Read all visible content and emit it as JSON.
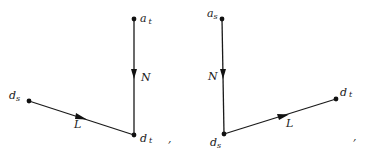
{
  "diagrams": [
    {
      "id": "left",
      "nodes": [
        {
          "name": "a_t",
          "base": "a",
          "sub": "t",
          "x": 134,
          "y": 19,
          "lx": 140,
          "ly": 22
        },
        {
          "name": "d_t",
          "base": "d",
          "sub": "t",
          "x": 134,
          "y": 135,
          "lx": 140,
          "ly": 142
        },
        {
          "name": "d_s",
          "base": "d",
          "sub": "s",
          "x": 29,
          "y": 101,
          "lx": 9,
          "ly": 99
        }
      ],
      "edges": [
        {
          "name": "N",
          "label": "N",
          "from": "a_t",
          "to": "d_t",
          "lx": 141,
          "ly": 81
        },
        {
          "name": "L",
          "label": "L",
          "from": "d_s",
          "to": "d_t",
          "lx": 74,
          "ly": 128
        }
      ],
      "punctuation": {
        "text": ",",
        "x": 168,
        "y": 142
      }
    },
    {
      "id": "right",
      "nodes": [
        {
          "name": "a_s",
          "base": "a",
          "sub": "s",
          "x": 222,
          "y": 19,
          "lx": 207,
          "ly": 17
        },
        {
          "name": "d_s",
          "base": "d",
          "sub": "s",
          "x": 224,
          "y": 134,
          "lx": 210,
          "ly": 146
        },
        {
          "name": "d_t",
          "base": "d",
          "sub": "t",
          "x": 336,
          "y": 99,
          "lx": 340,
          "ly": 96
        }
      ],
      "edges": [
        {
          "name": "N",
          "label": "N",
          "from": "a_s",
          "to": "d_s",
          "lx": 208,
          "ly": 80
        },
        {
          "name": "L",
          "label": "L",
          "from": "d_s",
          "to": "d_t",
          "lx": 286,
          "ly": 127
        }
      ],
      "punctuation": {
        "text": ",",
        "x": 353,
        "y": 140
      }
    }
  ],
  "colors": {
    "ink": "#1a1a1a",
    "background": "#ffffff"
  }
}
